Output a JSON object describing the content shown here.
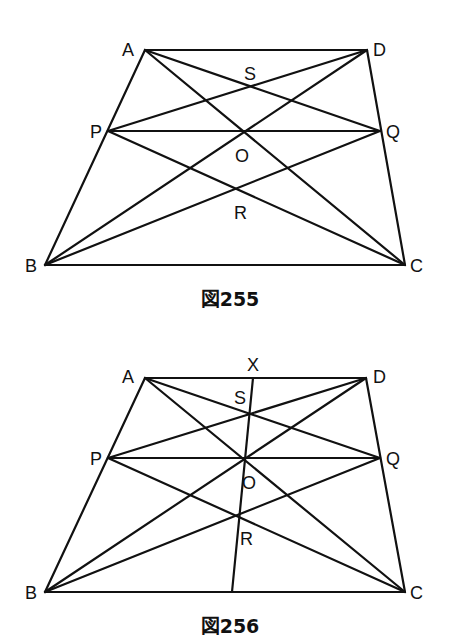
{
  "figures": [
    {
      "caption": "図255",
      "points": {
        "A": [
          145,
          50
        ],
        "D": [
          367,
          50
        ],
        "B": [
          45,
          265
        ],
        "C": [
          405,
          265
        ],
        "P": [
          108,
          131
        ],
        "Q": [
          380,
          131
        ]
      },
      "labels": [
        {
          "text": "A",
          "x": 122,
          "y": 56
        },
        {
          "text": "D",
          "x": 373,
          "y": 56
        },
        {
          "text": "S",
          "x": 244,
          "y": 80
        },
        {
          "text": "P",
          "x": 90,
          "y": 138
        },
        {
          "text": "Q",
          "x": 386,
          "y": 138
        },
        {
          "text": "O",
          "x": 235,
          "y": 162
        },
        {
          "text": "R",
          "x": 234,
          "y": 219
        },
        {
          "text": "B",
          "x": 25,
          "y": 272
        },
        {
          "text": "C",
          "x": 410,
          "y": 272
        }
      ],
      "segments": [
        [
          "A",
          "D"
        ],
        [
          "A",
          "B"
        ],
        [
          "D",
          "C"
        ],
        [
          "B",
          "C"
        ],
        [
          "P",
          "Q"
        ],
        [
          "A",
          "C"
        ],
        [
          "D",
          "B"
        ],
        [
          "A",
          "Q"
        ],
        [
          "D",
          "P"
        ],
        [
          "P",
          "C"
        ],
        [
          "Q",
          "B"
        ]
      ],
      "caption_pos": [
        230,
        306
      ]
    },
    {
      "caption": "図256",
      "points": {
        "A": [
          145,
          378
        ],
        "D": [
          366,
          378
        ],
        "B": [
          45,
          592
        ],
        "C": [
          405,
          592
        ],
        "P": [
          108,
          458
        ],
        "Q": [
          380,
          458
        ],
        "Xtop": [
          253,
          378
        ],
        "Xbot": [
          232,
          592
        ]
      },
      "labels": [
        {
          "text": "A",
          "x": 122,
          "y": 383
        },
        {
          "text": "X",
          "x": 247,
          "y": 371
        },
        {
          "text": "D",
          "x": 373,
          "y": 383
        },
        {
          "text": "S",
          "x": 234,
          "y": 404
        },
        {
          "text": "P",
          "x": 90,
          "y": 465
        },
        {
          "text": "Q",
          "x": 386,
          "y": 465
        },
        {
          "text": "O",
          "x": 242,
          "y": 489
        },
        {
          "text": "R",
          "x": 240,
          "y": 545
        },
        {
          "text": "B",
          "x": 25,
          "y": 599
        },
        {
          "text": "C",
          "x": 410,
          "y": 599
        }
      ],
      "segments": [
        [
          "A",
          "D"
        ],
        [
          "A",
          "B"
        ],
        [
          "D",
          "C"
        ],
        [
          "B",
          "C"
        ],
        [
          "P",
          "Q"
        ],
        [
          "A",
          "C"
        ],
        [
          "D",
          "B"
        ],
        [
          "A",
          "Q"
        ],
        [
          "D",
          "P"
        ],
        [
          "P",
          "C"
        ],
        [
          "Q",
          "B"
        ],
        [
          "Xtop",
          "Xbot"
        ]
      ],
      "caption_pos": [
        230,
        633
      ]
    }
  ]
}
